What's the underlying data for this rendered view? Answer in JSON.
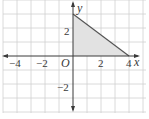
{
  "diagram": {
    "type": "coordinate-plane",
    "origin_label": "O",
    "x_axis_label": "x",
    "y_axis_label": "y",
    "x_ticks": [
      {
        "value": -4,
        "label": "−4"
      },
      {
        "value": -2,
        "label": "−2"
      },
      {
        "value": 2,
        "label": "2"
      },
      {
        "value": 4,
        "label": "4"
      }
    ],
    "y_ticks": [
      {
        "value": 2,
        "label": "2"
      },
      {
        "value": -2,
        "label": "−2"
      }
    ],
    "grid": true,
    "grid_range": {
      "x": [
        -5,
        5
      ],
      "y": [
        -4,
        4
      ]
    },
    "shaded_region": {
      "shape": "triangle",
      "vertices": [
        [
          0,
          0
        ],
        [
          4,
          0
        ],
        [
          0,
          3
        ]
      ]
    },
    "colors": {
      "grid": "#d0d0d0",
      "axis": "#3a3a3a",
      "fill": "#e2e2e2",
      "edge": "#555555"
    }
  }
}
